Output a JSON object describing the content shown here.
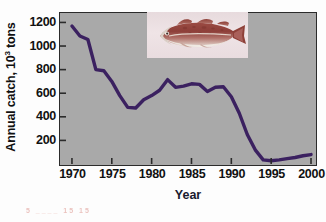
{
  "figure": {
    "plot_background_color": "#a9a9a9",
    "line_color": "#3b2160",
    "axis_color": "#2b2b2b",
    "page_background_color": "#fdfdfd"
  },
  "axes": {
    "ylabel_main": "Annual catch, 10",
    "ylabel_exponent": "3",
    "ylabel_unit": " tons",
    "xlabel": "Year",
    "yticks": [
      "1200",
      "1000",
      "800",
      "600",
      "400",
      "200"
    ],
    "ytick_values": [
      1200,
      1000,
      800,
      600,
      400,
      200
    ],
    "xticks": [
      "1970",
      "1975",
      "1980",
      "1985",
      "1990",
      "1995",
      "2000"
    ],
    "xtick_values": [
      1970,
      1975,
      1980,
      1985,
      1990,
      1995,
      2000
    ]
  },
  "inset": {
    "image_name": "atlantic-cod-photograph",
    "caption": ""
  },
  "artifact": {
    "text": "5 ____ 15 15"
  },
  "chart_data": {
    "type": "line",
    "title": "",
    "subtitle": "",
    "xlabel": "Year",
    "ylabel": "Annual catch, 10^3 tons",
    "xlim": [
      1968.5,
      2000.5
    ],
    "ylim": [
      0,
      1280
    ],
    "grid": false,
    "legend": null,
    "annotations": [
      {
        "kind": "image",
        "name": "atlantic-cod-photograph",
        "x_range": [
          1979.5,
          1991.5
        ],
        "y_range": [
          1020,
          1280
        ]
      }
    ],
    "series": [
      {
        "name": "Annual catch",
        "color": "#3b2160",
        "x": [
          1970,
          1971,
          1972,
          1973,
          1974,
          1975,
          1976,
          1977,
          1978,
          1979,
          1980,
          1981,
          1982,
          1983,
          1984,
          1985,
          1986,
          1987,
          1988,
          1989,
          1990,
          1991,
          1992,
          1993,
          1994,
          1995,
          1996,
          1997,
          1998,
          1999,
          2000
        ],
        "values": [
          1170,
          1085,
          1055,
          800,
          790,
          700,
          580,
          480,
          475,
          545,
          580,
          625,
          715,
          650,
          660,
          680,
          675,
          615,
          650,
          655,
          570,
          430,
          250,
          120,
          35,
          28,
          35,
          45,
          55,
          70,
          80
        ]
      }
    ]
  }
}
